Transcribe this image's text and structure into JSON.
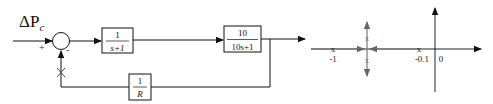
{
  "block_diagram": {
    "input_label_main": "ΔP",
    "input_label_sub": "c",
    "sum_plus": "+",
    "sum_minus": "-",
    "forward_block_1": {
      "numerator": "1",
      "denominator": "s+1"
    },
    "forward_block_2": {
      "numerator": "10",
      "denominator": "10s+1"
    },
    "feedback_block": {
      "numerator": "1",
      "denominator": "R"
    },
    "break_mark": "×"
  },
  "root_locus": {
    "pole_marker": "x",
    "labels": {
      "pole1": "-1",
      "pole2": "-0.1",
      "origin": "0"
    },
    "poles": [
      -1,
      -0.1
    ],
    "colors": {
      "axis": "#222222",
      "locus": "#777777"
    }
  }
}
